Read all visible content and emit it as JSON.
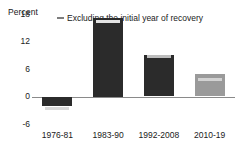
{
  "chart_data": {
    "type": "bar",
    "title": "",
    "subtitle": "",
    "xlabel": "",
    "ylabel": "Percent",
    "categories": [
      "1976-81",
      "1983-90",
      "1992-2008",
      "2010-19"
    ],
    "values": [
      -2.0,
      17.1,
      9.1,
      5.0
    ],
    "ylim": [
      -6,
      18
    ],
    "yticks": [
      18,
      12,
      6,
      0,
      -6
    ],
    "yticklabels": [
      "18",
      "12",
      "6",
      "0",
      "-6"
    ],
    "grid": false,
    "legend_position": "top-center",
    "series": [
      {
        "name": "Total",
        "values": [
          -2.0,
          17.1,
          9.1,
          5.0
        ]
      },
      {
        "name": "Excluding the initial year of recovery",
        "values": [
          -2.7,
          16.3,
          8.8,
          3.7
        ]
      }
    ],
    "legend": [
      {
        "label": "Excluding the initial year of recovery",
        "marker": "horizontal-dash",
        "color": "#7d7d7d"
      }
    ],
    "bar_colors": [
      "#2b2b2b",
      "#2b2b2b",
      "#2b2b2b",
      "#9a9a9a"
    ],
    "marker_colors": [
      "#d8d8d8",
      "#e4e4e4",
      "#bdbdbd",
      "#d2d2d2"
    ],
    "colors": {
      "dark_bar": "#2b2b2b",
      "light_bar": "#9a9a9a",
      "axis": "#8a8a8a",
      "text": "#1a1a1a",
      "marker": "#dcdcdc"
    }
  }
}
